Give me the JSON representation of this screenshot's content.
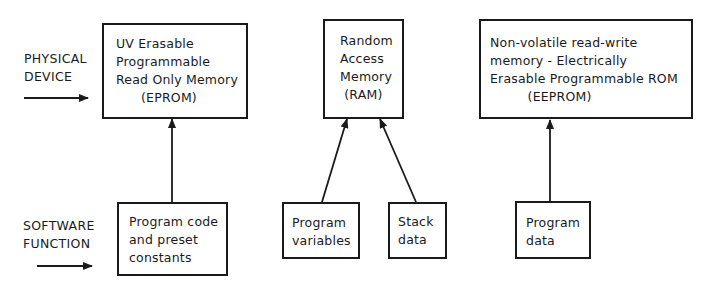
{
  "row_labels": {
    "physical_device": [
      "PHYSICAL",
      "DEVICE"
    ],
    "software_function": [
      "SOFTWARE",
      "FUNCTION"
    ]
  },
  "physical_devices": [
    {
      "id": "eprom",
      "lines": [
        "UV Erasable",
        "Programmable",
        "Read Only Memory",
        "(EPROM)"
      ]
    },
    {
      "id": "ram",
      "lines": [
        "Random",
        "Access",
        "Memory",
        "(RAM)"
      ]
    },
    {
      "id": "eeprom",
      "lines": [
        "Non-volatile read-write",
        "memory - Electrically",
        "Erasable Programmable ROM",
        "(EEPROM)"
      ]
    }
  ],
  "software_functions": [
    {
      "id": "program-code",
      "lines": [
        "Program code",
        "and preset",
        "constants"
      ],
      "target": "eprom"
    },
    {
      "id": "program-variables",
      "lines": [
        "Program",
        "variables"
      ],
      "target": "ram"
    },
    {
      "id": "stack-data",
      "lines": [
        "Stack",
        "data"
      ],
      "target": "ram"
    },
    {
      "id": "program-data",
      "lines": [
        "Program",
        "data"
      ],
      "target": "eeprom"
    }
  ],
  "colors": {
    "stroke": "#1a1a1a",
    "background": "#ffffff"
  }
}
